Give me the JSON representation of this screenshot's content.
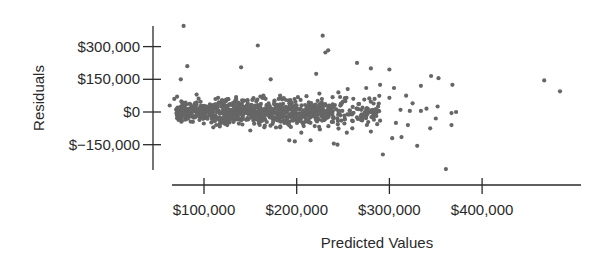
{
  "chart_data": {
    "type": "scatter",
    "title": "",
    "xlabel": "Predicted Values",
    "ylabel": "Residuals",
    "x_ticks": [
      {
        "value": 100000,
        "label": "$100,000"
      },
      {
        "value": 200000,
        "label": "$200,000"
      },
      {
        "value": 300000,
        "label": "$300,000"
      },
      {
        "value": 400000,
        "label": "$400,000"
      }
    ],
    "y_ticks": [
      {
        "value": 300000,
        "label": "$300,000"
      },
      {
        "value": 150000,
        "label": "$150,000"
      },
      {
        "value": 0,
        "label": "$0"
      },
      {
        "value": -150000,
        "label": "$−150,000"
      }
    ],
    "xlim": [
      60000,
      510000
    ],
    "ylim": [
      -265000,
      395000
    ],
    "grid": false,
    "legend": null,
    "marker_color": "#666666",
    "outliers": [
      [
        78000,
        395000
      ],
      [
        82000,
        210000
      ],
      [
        75000,
        150000
      ],
      [
        140000,
        205000
      ],
      [
        158000,
        305000
      ],
      [
        228000,
        350000
      ],
      [
        231000,
        273000
      ],
      [
        234000,
        283000
      ],
      [
        265000,
        225000
      ],
      [
        221000,
        175000
      ],
      [
        172000,
        150000
      ],
      [
        300000,
        195000
      ],
      [
        345000,
        165000
      ],
      [
        353000,
        155000
      ],
      [
        290000,
        125000
      ],
      [
        280000,
        200000
      ],
      [
        467000,
        145000
      ],
      [
        484000,
        95000
      ],
      [
        368000,
        125000
      ],
      [
        334000,
        120000
      ],
      [
        293000,
        -195000
      ],
      [
        361000,
        -262000
      ],
      [
        244000,
        -150000
      ],
      [
        240000,
        -145000
      ],
      [
        215000,
        -130000
      ],
      [
        192000,
        -130000
      ],
      [
        198000,
        -135000
      ],
      [
        330000,
        -155000
      ],
      [
        313000,
        -115000
      ],
      [
        344000,
        -75000
      ],
      [
        367000,
        -60000
      ],
      [
        367000,
        -5000
      ],
      [
        352000,
        25000
      ],
      [
        372000,
        0
      ],
      [
        303000,
        -120000
      ],
      [
        280000,
        -90000
      ],
      [
        260000,
        -75000
      ],
      [
        254000,
        -95000
      ],
      [
        320000,
        -60000
      ],
      [
        307000,
        -50000
      ],
      [
        325000,
        40000
      ],
      [
        318000,
        75000
      ],
      [
        300000,
        65000
      ],
      [
        284000,
        60000
      ],
      [
        305000,
        110000
      ],
      [
        275000,
        110000
      ],
      [
        255000,
        105000
      ],
      [
        245000,
        90000
      ],
      [
        334000,
        5000
      ],
      [
        322000,
        5000
      ],
      [
        312000,
        10000
      ],
      [
        340000,
        15000
      ],
      [
        290000,
        -40000
      ],
      [
        270000,
        -35000
      ],
      [
        265000,
        15000
      ],
      [
        350000,
        -30000
      ],
      [
        68000,
        60000
      ],
      [
        63000,
        30000
      ],
      [
        71000,
        70000
      ],
      [
        92000,
        80000
      ],
      [
        80000,
        -20000
      ],
      [
        88000,
        -45000
      ],
      [
        110000,
        -70000
      ],
      [
        125000,
        -60000
      ],
      [
        150000,
        -85000
      ],
      [
        165000,
        -70000
      ],
      [
        205000,
        -95000
      ],
      [
        225000,
        -80000
      ]
    ],
    "cluster": {
      "description": "Dense band of ~900 points between predicted $70,000 and $290,000, residuals mostly within ±$75,000, centered at $0",
      "x_range": [
        70000,
        290000
      ],
      "y_center": 0,
      "y_spread": 60000,
      "count": 900
    }
  }
}
